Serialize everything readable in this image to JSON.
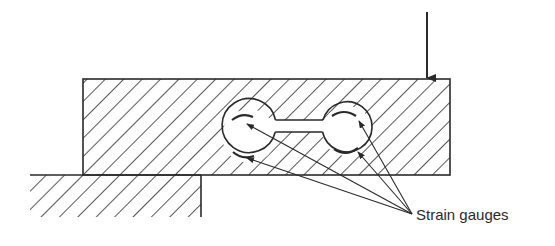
{
  "figure": {
    "type": "mechanical-section-diagram",
    "labels": {
      "strain_gauges": "Strain gauges"
    },
    "colors": {
      "line": "#2a2a2a",
      "background": "#ffffff"
    },
    "elements": {
      "load_arrow": {
        "x": 427,
        "y_start": 12,
        "y_end": 79
      },
      "beam": {
        "x": 83,
        "y": 79,
        "width": 367,
        "height": 96,
        "hatched": true
      },
      "support": {
        "x": 30,
        "y": 175,
        "width": 171,
        "height": 42,
        "hatched": true
      },
      "holes": [
        {
          "cx": 249,
          "cy": 136,
          "r": 27
        },
        {
          "cx": 347,
          "cy": 131,
          "r": 25
        }
      ],
      "gauges": [
        {
          "x": 240,
          "y": 118
        },
        {
          "x": 243,
          "y": 156
        },
        {
          "x": 356,
          "y": 116
        },
        {
          "x": 353,
          "y": 150
        }
      ],
      "leader_target": {
        "x": 412,
        "y": 214
      }
    }
  }
}
